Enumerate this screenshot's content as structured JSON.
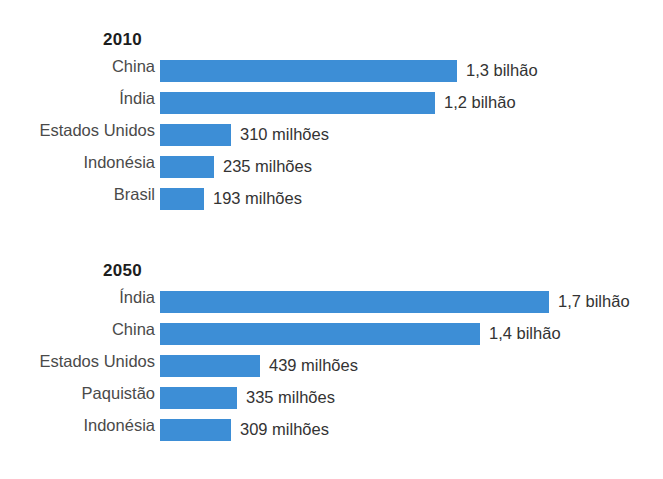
{
  "chart_data": {
    "type": "bar",
    "title": "",
    "orientation": "horizontal",
    "xlabel": "",
    "ylabel": "",
    "grid": false,
    "legend": null,
    "accent_color": "#3d8ed6",
    "label_color": "#4a4a4a",
    "value_color": "#333333",
    "axis_max": 1700,
    "unit_note": "valores em milhoes de habitantes",
    "panels": [
      {
        "id": "2010",
        "title": "2010",
        "categories": [
          "China",
          "Índia",
          "Estados Unidos",
          "Indonésia",
          "Brasil"
        ],
        "values": [
          1300,
          1200,
          310,
          235,
          193
        ],
        "value_labels": [
          "1,3 bilhão",
          "1,2 bilhão",
          "310 milhões",
          "235 milhões",
          "193 milhões"
        ]
      },
      {
        "id": "2050",
        "title": "2050",
        "categories": [
          "Índia",
          "China",
          "Estados Unidos",
          "Paquistão",
          "Indonésia"
        ],
        "values": [
          1700,
          1400,
          439,
          335,
          309
        ],
        "value_labels": [
          "1,7 bilhão",
          "1,4 bilhão",
          "439 milhões",
          "335 milhões",
          "309 milhões"
        ]
      }
    ]
  },
  "background_bleed": {
    "title": "",
    "lines": [
      "",
      "",
      "",
      "",
      "",
      "",
      "",
      "",
      "",
      "",
      "",
      "",
      "",
      "",
      "",
      ""
    ]
  }
}
